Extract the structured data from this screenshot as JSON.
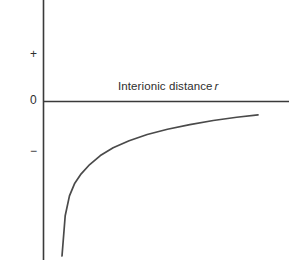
{
  "figure": {
    "background_color": "#ffffff",
    "line_color": "#3a3a3a",
    "text_color": "#2e2e2e"
  },
  "axes": {
    "y_axis_label": "Potential energy",
    "x_axis_label_text": "Interionic distance",
    "x_axis_label_symbol": "r",
    "y_ticks": [
      {
        "label": "+",
        "name": "positive"
      },
      {
        "label": "0",
        "name": "zero"
      },
      {
        "label": "−",
        "name": "negative"
      }
    ]
  },
  "chart_data": {
    "type": "line",
    "title": "",
    "xlabel": "Interionic distance r",
    "ylabel": "Potential energy",
    "xlim": [
      0,
      1
    ],
    "ylim": [
      -1,
      1
    ],
    "grid": false,
    "legend": null,
    "axis_origin_label": "0",
    "series": [
      {
        "name": "Coulombic attraction potential",
        "comment": "Monotonically increasing negative branch approaching zero asymptotically; energy is negative at all plotted distances.",
        "x": [
          0.08,
          0.095,
          0.115,
          0.14,
          0.17,
          0.21,
          0.26,
          0.32,
          0.395,
          0.48,
          0.575,
          0.68,
          0.79,
          0.9,
          1.0
        ],
        "y": [
          -1.0,
          -0.74,
          -0.612,
          -0.53,
          -0.47,
          -0.41,
          -0.352,
          -0.302,
          -0.256,
          -0.216,
          -0.182,
          -0.152,
          -0.126,
          -0.105,
          -0.09
        ]
      }
    ]
  },
  "geometry": {
    "y_axis_x": 43,
    "x_axis_y": 101,
    "plot_right": 289,
    "plot_bottom": 260,
    "curve_start_x": 62,
    "curve_start_y": 256,
    "curve_end_x": 258,
    "curve_end_y": 111
  }
}
